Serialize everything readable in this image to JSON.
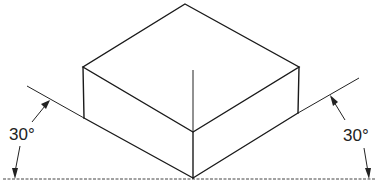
{
  "diagram": {
    "left_angle_label": "30°",
    "right_angle_label": "30°",
    "colors": {
      "line": "#1a1a1a",
      "background": "#ffffff"
    },
    "points": {
      "top": [
        185,
        4
      ],
      "left_top": [
        83,
        67
      ],
      "left_bottom": [
        84,
        118
      ],
      "right_top": [
        299,
        67
      ],
      "right_bottom": [
        298,
        113
      ],
      "front_top": [
        193,
        132
      ],
      "front_bottom": [
        193,
        178
      ],
      "center_axis_top": [
        193,
        70
      ]
    },
    "ground_line_y": 179
  }
}
